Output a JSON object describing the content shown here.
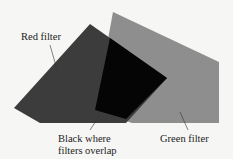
{
  "diagram": {
    "labels": {
      "red": "Red filter",
      "green": "Green filter",
      "overlap_line1": "Black where",
      "overlap_line2": "filters overlap"
    },
    "colors": {
      "background": "#f6f6f4",
      "red_filter": "#3c3c3c",
      "green_filter": "#8e8e8e",
      "overlap": "#050505"
    }
  }
}
